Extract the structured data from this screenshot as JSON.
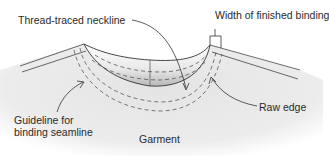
{
  "diagram": {
    "labels": {
      "neckline": "Thread-traced neckline",
      "binding_width": "Width of finished binding",
      "guideline_line1": "Guideline for",
      "guideline_line2": "binding seamline",
      "raw_edge": "Raw edge",
      "garment": "Garment"
    },
    "colors": {
      "line": "#333333",
      "fabric": "#e6e6e6",
      "fabric_edge": "#f4f4f4",
      "facing_light": "#ffffff",
      "facing_shadow": "#bdbdbd"
    }
  }
}
